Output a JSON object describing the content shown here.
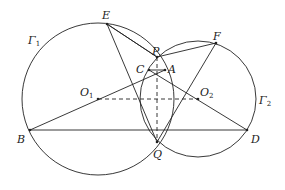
{
  "diagram": {
    "circles": [
      {
        "name": "Γ1",
        "label": "Γ",
        "sub": "1",
        "cx": 98,
        "cy": 99,
        "r": 76,
        "label_x": 28,
        "label_y": 44
      },
      {
        "name": "Γ2",
        "label": "Γ",
        "sub": "2",
        "cx": 198,
        "cy": 99,
        "r": 58,
        "label_x": 259,
        "label_y": 104
      }
    ],
    "points": [
      {
        "name": "E",
        "x": 107,
        "y": 24,
        "lx": 102,
        "ly": 19
      },
      {
        "name": "F",
        "x": 216,
        "y": 43,
        "lx": 213,
        "ly": 40
      },
      {
        "name": "P",
        "x": 157,
        "y": 57,
        "lx": 152,
        "ly": 55
      },
      {
        "name": "C",
        "x": 149,
        "y": 70,
        "lx": 136,
        "ly": 73
      },
      {
        "name": "A",
        "x": 165,
        "y": 70,
        "lx": 168,
        "ly": 73
      },
      {
        "name": "O1",
        "x": 98,
        "y": 99,
        "lx": 80,
        "ly": 96,
        "sub": "1"
      },
      {
        "name": "O2",
        "x": 198,
        "y": 99,
        "lx": 200,
        "ly": 96,
        "sub": "2"
      },
      {
        "name": "B",
        "x": 30,
        "y": 130,
        "lx": 17,
        "ly": 143
      },
      {
        "name": "D",
        "x": 247,
        "y": 130,
        "lx": 251,
        "ly": 143
      },
      {
        "name": "Q",
        "x": 157,
        "y": 142,
        "lx": 153,
        "ly": 158
      }
    ],
    "segments": [
      [
        "E",
        "P"
      ],
      [
        "E",
        "Q"
      ],
      [
        "P",
        "F"
      ],
      [
        "F",
        "Q"
      ],
      [
        "B",
        "A"
      ],
      [
        "C",
        "D"
      ],
      [
        "B",
        "D"
      ],
      [
        "C",
        "A"
      ],
      [
        "E",
        "P"
      ]
    ],
    "dashed": [
      [
        "P",
        "Q"
      ],
      [
        "O1",
        "O2"
      ]
    ]
  }
}
